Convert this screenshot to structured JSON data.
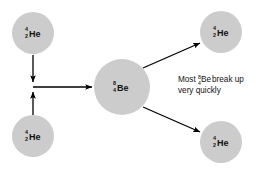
{
  "figure": {
    "background_color": "#ffffff",
    "nucleus_fill": "#cccccc",
    "arrow_color": "#000000",
    "text_color": "#111111"
  },
  "nuclei": [
    {
      "id": "helium-top-left",
      "symbol": "He",
      "mass_number": "4",
      "atomic_number": "2",
      "cx": 33,
      "cy": 33,
      "r": 21
    },
    {
      "id": "helium-bottom-left",
      "symbol": "He",
      "mass_number": "4",
      "atomic_number": "2",
      "cx": 33,
      "cy": 136,
      "r": 21
    },
    {
      "id": "beryllium-center",
      "symbol": "Be",
      "mass_number": "8",
      "atomic_number": "4",
      "cx": 122,
      "cy": 87,
      "r": 28
    },
    {
      "id": "helium-top-right",
      "symbol": "He",
      "mass_number": "4",
      "atomic_number": "2",
      "cx": 221,
      "cy": 32,
      "r": 21
    },
    {
      "id": "helium-bottom-right",
      "symbol": "He",
      "mass_number": "4",
      "atomic_number": "2",
      "cx": 221,
      "cy": 142,
      "r": 21
    }
  ],
  "arrows": [
    {
      "id": "arrow-down-from-top-helium",
      "x1": 33,
      "y1": 55,
      "x2": 33,
      "y2": 82
    },
    {
      "id": "arrow-up-from-bottom-helium",
      "x1": 33,
      "y1": 115,
      "x2": 33,
      "y2": 92
    },
    {
      "id": "arrow-right-to-beryllium",
      "x1": 33,
      "y1": 87,
      "x2": 92,
      "y2": 87
    },
    {
      "id": "arrow-upright-to-helium",
      "x1": 143,
      "y1": 68,
      "x2": 200,
      "y2": 43
    },
    {
      "id": "arrow-downright-to-helium",
      "x1": 143,
      "y1": 107,
      "x2": 200,
      "y2": 132
    }
  ],
  "annotation": {
    "id": "breakup-note",
    "line1_prefix": "Most ",
    "line1_mass_number": "8",
    "line1_atomic_number": "4",
    "line1_symbol": "Be",
    "line1_suffix": " break up",
    "line2": "very quickly",
    "full_text": "Most 8-4 Be break up very quickly"
  }
}
